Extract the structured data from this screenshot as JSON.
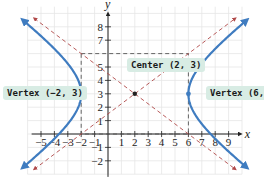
{
  "chart_data": {
    "type": "diagram",
    "title": "",
    "equation": "(x-2)^2/16 - (y-3)^2/9 = 1",
    "xlabel": "x",
    "ylabel": "y",
    "x_ticks": [
      -5,
      -4,
      -3,
      -2,
      -1,
      1,
      2,
      3,
      4,
      5,
      6,
      7,
      8,
      9
    ],
    "y_ticks": [
      -2,
      -1,
      1,
      2,
      3,
      4,
      5,
      7,
      8
    ],
    "xlim": [
      -6,
      10
    ],
    "ylim": [
      -3,
      9.5
    ],
    "grid": true,
    "center": [
      2,
      3
    ],
    "vertices": [
      [
        -2,
        3
      ],
      [
        6,
        3
      ]
    ],
    "a": 4,
    "b": 3,
    "asymptotes": [
      "y - 3 = 3/4 (x - 2)",
      "y - 3 = -3/4 (x - 2)"
    ],
    "rectangle": {
      "x": [
        -2,
        6
      ],
      "y": [
        0,
        6
      ]
    },
    "colors": {
      "curve": "#3f7cc0",
      "asymptote": "#b04848",
      "rectangle": "#555555",
      "callout_bg": "#d8ece4"
    }
  },
  "labels": {
    "vertex_left": "Vertex (−2, 3)",
    "vertex_right": "Vertex (6, 3)",
    "center": "Center (2, 3)",
    "x_axis": "x",
    "y_axis": "y"
  },
  "tick_text": {
    "x": [
      "−5",
      "−4",
      "−3",
      "−2",
      "−1",
      "1",
      "2",
      "3",
      "4",
      "5",
      "6",
      "7",
      "8",
      "9"
    ],
    "y": [
      "−2",
      "−1",
      "1",
      "2",
      "3",
      "4",
      "5",
      "7",
      "8"
    ]
  }
}
